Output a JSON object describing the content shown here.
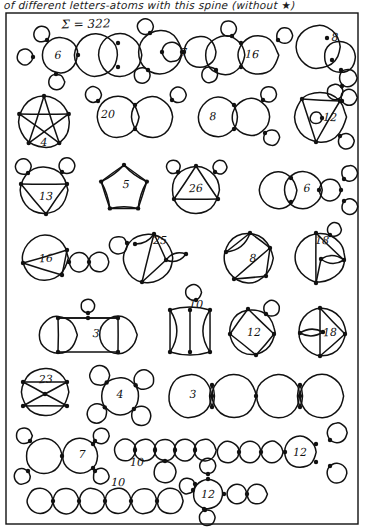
{
  "header": {
    "caption": "of different letters-atoms with this spine (without  ★)"
  },
  "frame": {
    "label": "page-border"
  },
  "sum_note": {
    "text": "Σ = 322"
  },
  "rows": [
    {
      "row_index": 1,
      "diagrams": [
        {
          "label": "6",
          "shape": "two-big-circles-with-three-loops"
        },
        {
          "label": "7",
          "shape": "big-circle-inner-circle-plus-loops"
        },
        {
          "label": "16",
          "shape": "two-tangent-circles-with-four-loops"
        },
        {
          "label": "8",
          "shape": "overlapping-circles-with-loop-chain"
        }
      ]
    },
    {
      "row_index": 2,
      "diagrams": [
        {
          "label": "4",
          "shape": "pentagram-in-circle"
        },
        {
          "label": "20",
          "shape": "two-tangent-circles-with-side-loops"
        },
        {
          "label": "8",
          "shape": "two-tangent-circles-with-loops-right"
        },
        {
          "label": "12",
          "shape": "triangle-in-circle-with-loops"
        }
      ]
    },
    {
      "row_index": 3,
      "diagrams": [
        {
          "label": "13",
          "shape": "circle-with-triangle-and-two-loops"
        },
        {
          "label": "5",
          "shape": "pentagon-in-circle"
        },
        {
          "label": "26",
          "shape": "triangle-in-circle-with-two-loops"
        },
        {
          "label": "6",
          "shape": "two-circles-plus-two-small-loops"
        }
      ]
    },
    {
      "row_index": 4,
      "diagrams": [
        {
          "label": "16",
          "shape": "triangle-circle-plus-two-small-circles"
        },
        {
          "label": "25",
          "shape": "circle-with-chords-and-loop"
        },
        {
          "label": "8",
          "shape": "circle-with-quadrilateral-and-loop"
        },
        {
          "label": "18",
          "shape": "circle-with-lens-and-chords"
        }
      ]
    },
    {
      "row_index": 5,
      "diagrams": [
        {
          "label": "3",
          "shape": "two-circles-rectangle-with-top-loop"
        },
        {
          "label": "10",
          "shape": "ladder-of-lenses"
        },
        {
          "label": "12",
          "shape": "quadrilateral-in-circle-with-loop"
        },
        {
          "label": "18",
          "shape": "circle-with-lens-and-triangle"
        }
      ]
    },
    {
      "row_index": 6,
      "diagrams": [
        {
          "label": "23",
          "shape": "circle-with-crossed-quadrilateral"
        },
        {
          "label": "4",
          "shape": "central-circle-with-four-loops"
        },
        {
          "label": "3",
          "shape": "chain-of-four-circles-with-lenses"
        }
      ]
    },
    {
      "row_index": 7,
      "diagrams": [
        {
          "label": "7",
          "shape": "two-circles-with-four-small-loops"
        },
        {
          "label": "10",
          "shape": "chain-of-circles-with-hanging-loop"
        },
        {
          "label": "12",
          "shape": "circle-chain-with-two-right-loops"
        }
      ]
    },
    {
      "row_index": 8,
      "diagrams": [
        {
          "label": "10",
          "shape": "chain-of-six-circles"
        },
        {
          "label": "12",
          "shape": "circle-with-three-loops-and-chain"
        }
      ]
    }
  ],
  "style": {
    "ink": "#111111",
    "paper": "#ffffff",
    "node_radius_px": 2.2
  },
  "totals": {
    "sum_label": "Σ",
    "sum_value": "322"
  }
}
